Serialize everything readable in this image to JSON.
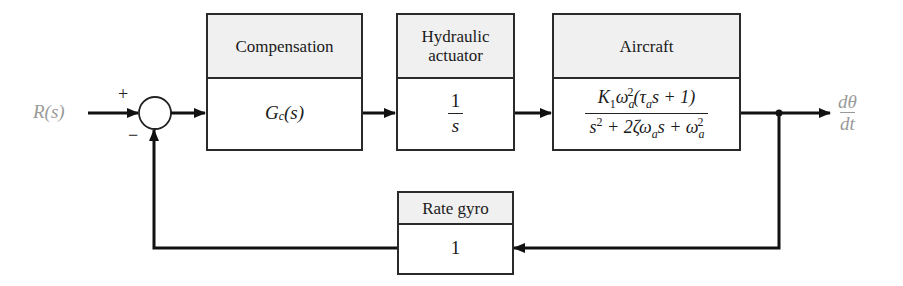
{
  "diagram": {
    "type": "feedback-block-diagram",
    "input": {
      "label": "R(s)"
    },
    "output": {
      "label_num": "dθ",
      "label_den": "dt"
    },
    "summing_junction": {
      "plus_sign": "+",
      "minus_sign": "−"
    },
    "blocks": {
      "compensation": {
        "title": "Compensation",
        "tf": "Gc(s)",
        "tf_main": "G",
        "tf_sub": "c",
        "tf_arg": "(s)"
      },
      "actuator": {
        "title_line1": "Hydraulic",
        "title_line2": "actuator",
        "tf_num": "1",
        "tf_den": "s"
      },
      "aircraft": {
        "title": "Aircraft",
        "tf_num": "K1 ωa^2 (τa s + 1)",
        "tf_den": "s^2 + 2ζ ωa s + ωa^2"
      },
      "rate_gyro": {
        "title": "Rate gyro",
        "tf": "1"
      }
    },
    "colors": {
      "line": "#111111",
      "header_bg": "#f0f0f0",
      "signal_label": "#9a9a9a"
    }
  }
}
